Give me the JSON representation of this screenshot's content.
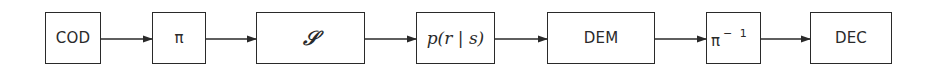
{
  "diagram": {
    "type": "block-diagram",
    "direction": "left-to-right",
    "colors": {
      "stroke": "#2a2a2a",
      "background": "#ffffff"
    },
    "blocks": [
      {
        "id": "cod",
        "label": "COD"
      },
      {
        "id": "interleaver",
        "label": "π"
      },
      {
        "id": "modulator",
        "label": "𝒮"
      },
      {
        "id": "channel",
        "label": "p(r | s)"
      },
      {
        "id": "demodulator",
        "label": "DEM"
      },
      {
        "id": "deinterleaver",
        "label": "π",
        "superscript": "− 1"
      },
      {
        "id": "dec",
        "label": "DEC"
      }
    ],
    "edges": [
      {
        "from": "cod",
        "to": "interleaver"
      },
      {
        "from": "interleaver",
        "to": "modulator"
      },
      {
        "from": "modulator",
        "to": "channel"
      },
      {
        "from": "channel",
        "to": "demodulator"
      },
      {
        "from": "demodulator",
        "to": "deinterleaver"
      },
      {
        "from": "deinterleaver",
        "to": "dec"
      }
    ]
  }
}
